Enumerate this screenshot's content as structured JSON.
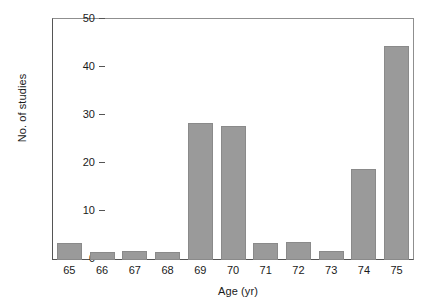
{
  "chart_data": {
    "type": "bar",
    "title": "",
    "subtitle": "",
    "xlabel": "Age (yr)",
    "ylabel": "No. of studies",
    "categories": [
      "65",
      "66",
      "67",
      "68",
      "69",
      "70",
      "71",
      "72",
      "73",
      "74",
      "75"
    ],
    "values": [
      3.5,
      1.7,
      1.8,
      1.7,
      28.5,
      28.0,
      3.6,
      3.7,
      1.8,
      19.0,
      44.5
    ],
    "series": [
      {
        "name": "No. of studies",
        "values": [
          3.5,
          1.7,
          1.8,
          1.7,
          28.5,
          28.0,
          3.6,
          3.7,
          1.8,
          19.0,
          44.5
        ]
      }
    ],
    "ylim": [
      0,
      50
    ],
    "y_ticks": [
      0,
      10,
      20,
      30,
      40,
      50
    ],
    "y_tick_labels": [
      "0",
      "10",
      "20",
      "30",
      "40",
      "50"
    ],
    "x_tick_labels": [
      "65",
      "66",
      "67",
      "68",
      "69",
      "70",
      "71",
      "72",
      "73",
      "74",
      "75"
    ],
    "grid": false,
    "legend": false,
    "legend_position": "none",
    "bar_color": "#9a9a9a",
    "bar_edge_color": "#8a8a8a",
    "axis_color": "#555555",
    "background_color": "#ffffff",
    "frame": "box"
  }
}
